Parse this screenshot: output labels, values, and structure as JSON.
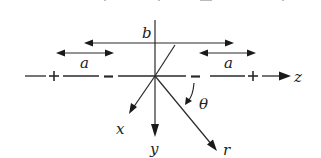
{
  "diagram": {
    "type": "coordinate-geometry",
    "labels": {
      "b": "b",
      "a_left": "a",
      "a_right": "a",
      "theta": "θ",
      "x": "x",
      "y": "y",
      "z": "z",
      "r": "r"
    },
    "charges": {
      "left_outer": "+",
      "left_inner": "−",
      "right_inner": "−",
      "right_outer": "+"
    },
    "colors": {
      "line": "#2a2a2a",
      "text": "#222222",
      "background": "#ffffff"
    }
  }
}
